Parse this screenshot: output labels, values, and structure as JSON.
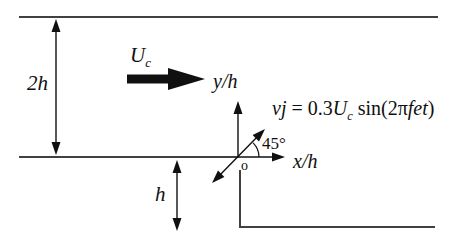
{
  "figure": {
    "labels": {
      "height_upper": "2h",
      "height_step": "h",
      "velocity_main": "U",
      "velocity_sub": "c",
      "y_axis": "y/h",
      "x_axis": "x/h",
      "angle": "45°",
      "origin": "o"
    },
    "equation": {
      "p1": "vj",
      "p2": " = 0.3",
      "p3": "U",
      "p4": "c",
      "p5": " sin(2π",
      "p6": "fet",
      "p7": ")"
    },
    "colors": {
      "line": "#414141",
      "ink": "#101010",
      "background": "#ffffff"
    }
  }
}
